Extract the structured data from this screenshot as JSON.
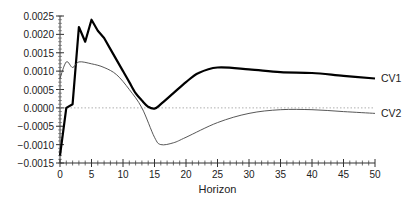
{
  "chart_data": {
    "type": "line",
    "title": "",
    "xlabel": "Horizon",
    "ylabel": "",
    "xlim": [
      0,
      50
    ],
    "ylim": [
      -0.0015,
      0.0025
    ],
    "x_ticks": [
      "0",
      "5",
      "10",
      "15",
      "20",
      "25",
      "30",
      "35",
      "40",
      "45",
      "50"
    ],
    "y_ticks": [
      "0.0025",
      "0.0020",
      "0.0015",
      "0.0010",
      "0.0005",
      "0.0000",
      "−0.0005",
      "−0.0010",
      "−0.0015"
    ],
    "zero_line": "dotted",
    "grid": false,
    "legend_position": "inline-right",
    "series": [
      {
        "name": "CV1",
        "style": "thick",
        "color": "#000000",
        "x": [
          0,
          1,
          2,
          3,
          4,
          5,
          6,
          7,
          8,
          9,
          10,
          11,
          12,
          13,
          14,
          15,
          16,
          18,
          20,
          22,
          25,
          30,
          35,
          40,
          45,
          50
        ],
        "values": [
          -0.0013,
          0.0,
          0.0001,
          0.0022,
          0.0018,
          0.0024,
          0.0021,
          0.0019,
          0.0016,
          0.0013,
          0.001,
          0.0007,
          0.0004,
          0.0002,
          3e-05,
          -2e-05,
          0.0001,
          0.0004,
          0.0007,
          0.00095,
          0.0011,
          0.00105,
          0.00097,
          0.00095,
          0.00087,
          0.0008
        ]
      },
      {
        "name": "CV2",
        "style": "thin",
        "color": "#444444",
        "x": [
          0,
          1,
          2,
          3,
          5,
          7,
          9,
          11,
          13,
          15,
          16,
          18,
          20,
          25,
          30,
          35,
          40,
          45,
          50
        ],
        "values": [
          0.0008,
          0.00125,
          0.0011,
          0.00125,
          0.0012,
          0.0011,
          0.0009,
          0.0005,
          0.0,
          -0.0008,
          -0.001,
          -0.00095,
          -0.0008,
          -0.0004,
          -0.00015,
          -5e-05,
          -5e-05,
          -0.0001,
          -0.00015
        ]
      }
    ]
  }
}
